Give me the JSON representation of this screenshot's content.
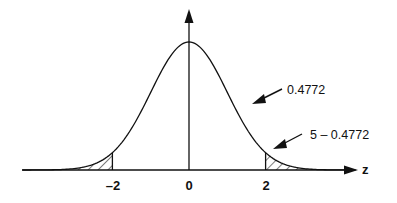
{
  "figure": {
    "type": "normal-distribution-diagram",
    "axis": {
      "x_label": "z",
      "tick_labels": [
        "–2",
        "0",
        "2"
      ],
      "tick_values": [
        -2,
        0,
        2
      ]
    },
    "annotations": {
      "central_area": "0.4772",
      "tail_area": "5 – 0.4772"
    },
    "shaded_regions": [
      {
        "name": "left-tail",
        "from": "-inf",
        "to": -2
      },
      {
        "name": "right-tail",
        "from": 2,
        "to": "inf"
      }
    ],
    "colors": {
      "line": "#111111",
      "background": "#ffffff"
    }
  }
}
